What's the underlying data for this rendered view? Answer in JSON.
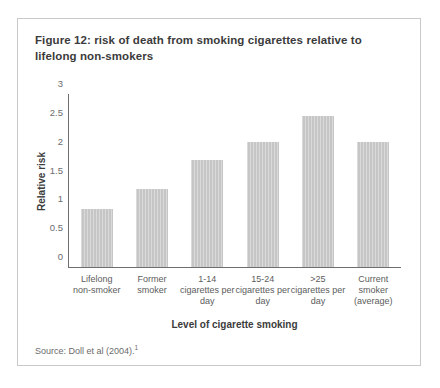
{
  "figure": {
    "title": "Figure 12: risk of death from smoking cigarettes relative to lifelong non-smokers",
    "source_text": "Source: Doll et al (2004).",
    "source_footnote_marker": "1"
  },
  "chart_data": {
    "type": "bar",
    "title": "Figure 12: risk of death from smoking cigarettes relative to lifelong non-smokers",
    "xlabel": "Level of cigarette smoking",
    "ylabel": "Relative risk",
    "ylim": [
      0,
      3
    ],
    "ytick_labels": [
      "3",
      "2.5",
      "2",
      "1.5",
      "1",
      "0.5",
      "0"
    ],
    "ytick_values": [
      3,
      2.5,
      2,
      1.5,
      1,
      0.5,
      0
    ],
    "grid": false,
    "legend": "none",
    "bar_color": "#c6c6c6",
    "categories": [
      "Lifelong non-smoker",
      "Former smoker",
      "1-14 cigarettes per day",
      "15-24 cigarettes per day",
      ">25 cigarettes per day",
      "Current smoker (average)"
    ],
    "category_lines": [
      [
        "Lifelong",
        "non-smoker"
      ],
      [
        "Former",
        "smoker"
      ],
      [
        "1-14",
        "cigarettes per",
        "day"
      ],
      [
        "15-24",
        "cigarettes per",
        "day"
      ],
      [
        ">25",
        "cigarettes per",
        "day"
      ],
      [
        "Current",
        "smoker",
        "(average)"
      ]
    ],
    "values": [
      1.0,
      1.35,
      1.85,
      2.17,
      2.62,
      2.17
    ]
  }
}
